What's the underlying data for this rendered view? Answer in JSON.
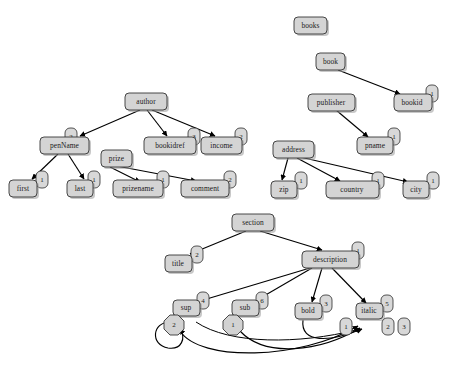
{
  "diagram": {
    "background_color": "#ffffff",
    "node_fill": "#d4d4d4",
    "node_stroke": "#2b2b2b",
    "edge_color": "#000000",
    "graphs": [
      {
        "name": "author-graph",
        "nodes": [
          {
            "id": "author",
            "label": "author",
            "badge": null,
            "x": 146,
            "y": 101,
            "w": 42,
            "h": 17
          },
          {
            "id": "penName",
            "label": "penName",
            "badge": "2",
            "x": 64,
            "y": 145,
            "w": 49,
            "h": 17
          },
          {
            "id": "prize",
            "label": "prize",
            "badge": null,
            "x": 116,
            "y": 158,
            "w": 31,
            "h": 17
          },
          {
            "id": "bookidref",
            "label": "bookidref",
            "badge": "3",
            "x": 170,
            "y": 145,
            "w": 52,
            "h": 17
          },
          {
            "id": "income",
            "label": "income",
            "badge": "2",
            "x": 221,
            "y": 145,
            "w": 41,
            "h": 17
          },
          {
            "id": "first",
            "label": "first",
            "badge": "1",
            "x": 23,
            "y": 188,
            "w": 28,
            "h": 17
          },
          {
            "id": "last",
            "label": "last",
            "badge": "1",
            "x": 80,
            "y": 188,
            "w": 26,
            "h": 17
          },
          {
            "id": "prizename",
            "label": "prizename",
            "badge": "1",
            "x": 138,
            "y": 188,
            "w": 50,
            "h": 17
          },
          {
            "id": "comment",
            "label": "comment",
            "badge": "2",
            "x": 205,
            "y": 188,
            "w": 48,
            "h": 17
          }
        ],
        "edges": [
          {
            "from": "author",
            "to": "penName"
          },
          {
            "from": "author",
            "to": "bookidref"
          },
          {
            "from": "author",
            "to": "income"
          },
          {
            "from": "penName",
            "to": "first"
          },
          {
            "from": "penName",
            "to": "last"
          },
          {
            "from": "prize",
            "to": "prizename"
          },
          {
            "from": "prize",
            "to": "comment"
          }
        ]
      },
      {
        "name": "books-graph",
        "nodes": [
          {
            "id": "books",
            "label": "books",
            "badge": null,
            "x": 311,
            "y": 25,
            "w": 33,
            "h": 17
          },
          {
            "id": "book",
            "label": "book",
            "badge": null,
            "x": 331,
            "y": 61,
            "w": 29,
            "h": 17
          },
          {
            "id": "bookid",
            "label": "bookid",
            "badge": "1",
            "x": 412,
            "y": 101,
            "w": 38,
            "h": 17
          },
          {
            "id": "publisher",
            "label": "publisher",
            "badge": null,
            "x": 331,
            "y": 101,
            "w": 47,
            "h": 17
          },
          {
            "id": "pname",
            "label": "pname",
            "badge": "1",
            "x": 375,
            "y": 145,
            "w": 36,
            "h": 17
          },
          {
            "id": "address",
            "label": "address",
            "badge": null,
            "x": 294,
            "y": 149,
            "w": 41,
            "h": 17
          },
          {
            "id": "zip",
            "label": "zip",
            "badge": "1",
            "x": 284,
            "y": 189,
            "w": 26,
            "h": 17
          },
          {
            "id": "country",
            "label": "country",
            "badge": "1",
            "x": 352,
            "y": 189,
            "w": 53,
            "h": 17
          },
          {
            "id": "city",
            "label": "city",
            "badge": "1",
            "x": 416,
            "y": 189,
            "w": 26,
            "h": 17
          }
        ],
        "edges": [
          {
            "from": "book",
            "to": "bookid"
          },
          {
            "from": "publisher",
            "to": "pname"
          },
          {
            "from": "address",
            "to": "zip"
          },
          {
            "from": "address",
            "to": "country"
          },
          {
            "from": "address",
            "to": "city"
          }
        ]
      },
      {
        "name": "section-graph",
        "nodes": [
          {
            "id": "section",
            "label": "section",
            "badge": null,
            "x": 253,
            "y": 222,
            "w": 42,
            "h": 17
          },
          {
            "id": "title",
            "label": "title",
            "badge": "2",
            "x": 178,
            "y": 263,
            "w": 27,
            "h": 17
          },
          {
            "id": "description",
            "label": "description",
            "badge": "1",
            "x": 330,
            "y": 259,
            "w": 57,
            "h": 17
          },
          {
            "id": "sup",
            "label": "sup",
            "badge": "4",
            "x": 186,
            "y": 308,
            "w": 27,
            "h": 16
          },
          {
            "id": "sub",
            "label": "sub",
            "badge": "6",
            "x": 245,
            "y": 308,
            "w": 27,
            "h": 16
          },
          {
            "id": "bold",
            "label": "bold",
            "badge": "3",
            "x": 308,
            "y": 311,
            "w": 27,
            "h": 16
          },
          {
            "id": "italic",
            "label": "italic",
            "badge": "5",
            "x": 369,
            "y": 311,
            "w": 27,
            "h": 16
          }
        ],
        "octagon_badges": [
          {
            "for": "sup",
            "label": "2",
            "x": 174,
            "y": 325
          },
          {
            "for": "sub",
            "label": "1",
            "x": 233,
            "y": 325
          },
          {
            "for": "italic",
            "label": "1",
            "x": 346,
            "y": 328
          },
          {
            "for": "italic",
            "label": "2",
            "x": 388,
            "y": 328
          },
          {
            "for": "italic",
            "label": "3",
            "x": 404,
            "y": 328
          }
        ],
        "edges": [
          {
            "from": "section",
            "to": "title"
          },
          {
            "from": "section",
            "to": "description"
          },
          {
            "from": "description",
            "to": "sup"
          },
          {
            "from": "description",
            "to": "sub"
          },
          {
            "from": "description",
            "to": "bold"
          },
          {
            "from": "description",
            "to": "italic"
          },
          {
            "from": "sup",
            "to": "sup",
            "kind": "self-loop"
          },
          {
            "from": "sup",
            "to": "italic",
            "kind": "curve"
          },
          {
            "from": "sub",
            "to": "italic",
            "kind": "curve"
          },
          {
            "from": "bold",
            "to": "italic",
            "kind": "curve"
          }
        ]
      }
    ]
  }
}
